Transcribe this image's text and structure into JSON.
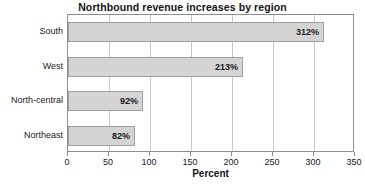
{
  "chart_data": {
    "type": "bar",
    "orientation": "horizontal",
    "title": "Northbound revenue increases by region",
    "xlabel": "Percent",
    "ylabel": "",
    "categories": [
      "South",
      "West",
      "North-central",
      "Northeast"
    ],
    "values": [
      312,
      213,
      92,
      82
    ],
    "value_labels": [
      "312%",
      "213%",
      "92%",
      "82%"
    ],
    "xlim": [
      0,
      350
    ],
    "xticks": [
      0,
      50,
      100,
      150,
      200,
      250,
      300,
      350
    ],
    "xtick_labels": [
      "0",
      "50",
      "100",
      "150",
      "200",
      "250",
      "300",
      "350"
    ],
    "grid": "vertical",
    "legend": "none",
    "bar_color": "#d4d4d4",
    "bar_border_color": "#a0a0a0",
    "gridline_color": "#c9c9c9",
    "axis_color": "#8d8d8d",
    "text_color": "#1a1a1a"
  }
}
